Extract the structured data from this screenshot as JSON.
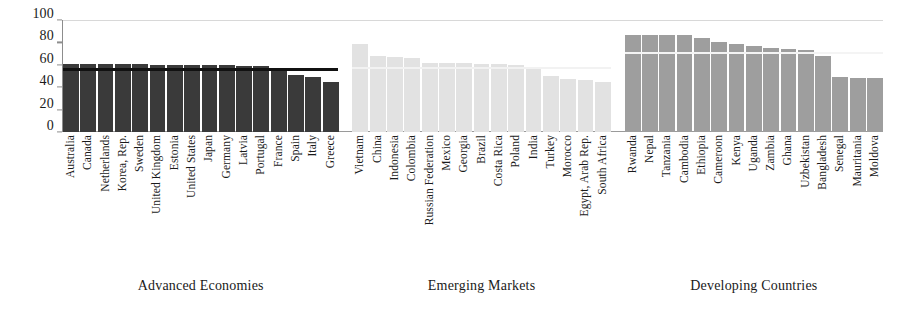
{
  "chart_data": {
    "type": "bar",
    "title": "",
    "subtitle": "",
    "xlabel": "",
    "ylabel": "",
    "ylim": [
      0,
      100
    ],
    "yticks": [
      0,
      20,
      40,
      60,
      80,
      100
    ],
    "grid": false,
    "legend_position": "none",
    "orientation": "vertical",
    "groups": [
      {
        "name": "Advanced Economies",
        "color": "#3a3a3a",
        "average_line_value": 57,
        "average_line_color": "#111111",
        "categories": [
          "Australia",
          "Canada",
          "Netherlands",
          "Korea, Rep.",
          "Sweden",
          "United Kingdom",
          "Estonia",
          "United States",
          "Japan",
          "Germany",
          "Latvia",
          "Portugal",
          "France",
          "Spain",
          "Italy",
          "Greece"
        ],
        "values": [
          61,
          61,
          61,
          61,
          61,
          60,
          60,
          60,
          60,
          60,
          59,
          59,
          55,
          51,
          49,
          45
        ]
      },
      {
        "name": "Emerging Markets",
        "color": "#e2e2e2",
        "average_line_value": 58,
        "average_line_color": "#f2f2f2",
        "categories": [
          "Vietnam",
          "China",
          "Indonesia",
          "Colombia",
          "Russian Federation",
          "Mexico",
          "Georgia",
          "Brazil",
          "Costa Rica",
          "Poland",
          "India",
          "Turkey",
          "Morocco",
          "Egypt, Arab Rep.",
          "South Africa"
        ],
        "values": [
          79,
          68,
          67,
          66,
          62,
          62,
          62,
          61,
          61,
          60,
          56,
          50,
          47,
          46,
          45
        ]
      },
      {
        "name": "Developing Countries",
        "color": "#9e9e9e",
        "average_line_value": 71,
        "average_line_color": "#f4f4f4",
        "categories": [
          "Rwanda",
          "Nepal",
          "Tanzania",
          "Cambodia",
          "Ethiopia",
          "Cameroon",
          "Kenya",
          "Uganda",
          "Zambia",
          "Ghana",
          "Uzbekistan",
          "Bangladesh",
          "Senegal",
          "Mauritania",
          "Moldova"
        ],
        "values": [
          87,
          87,
          87,
          87,
          84,
          80,
          79,
          77,
          75,
          74,
          73,
          68,
          49,
          48,
          48
        ]
      }
    ]
  }
}
